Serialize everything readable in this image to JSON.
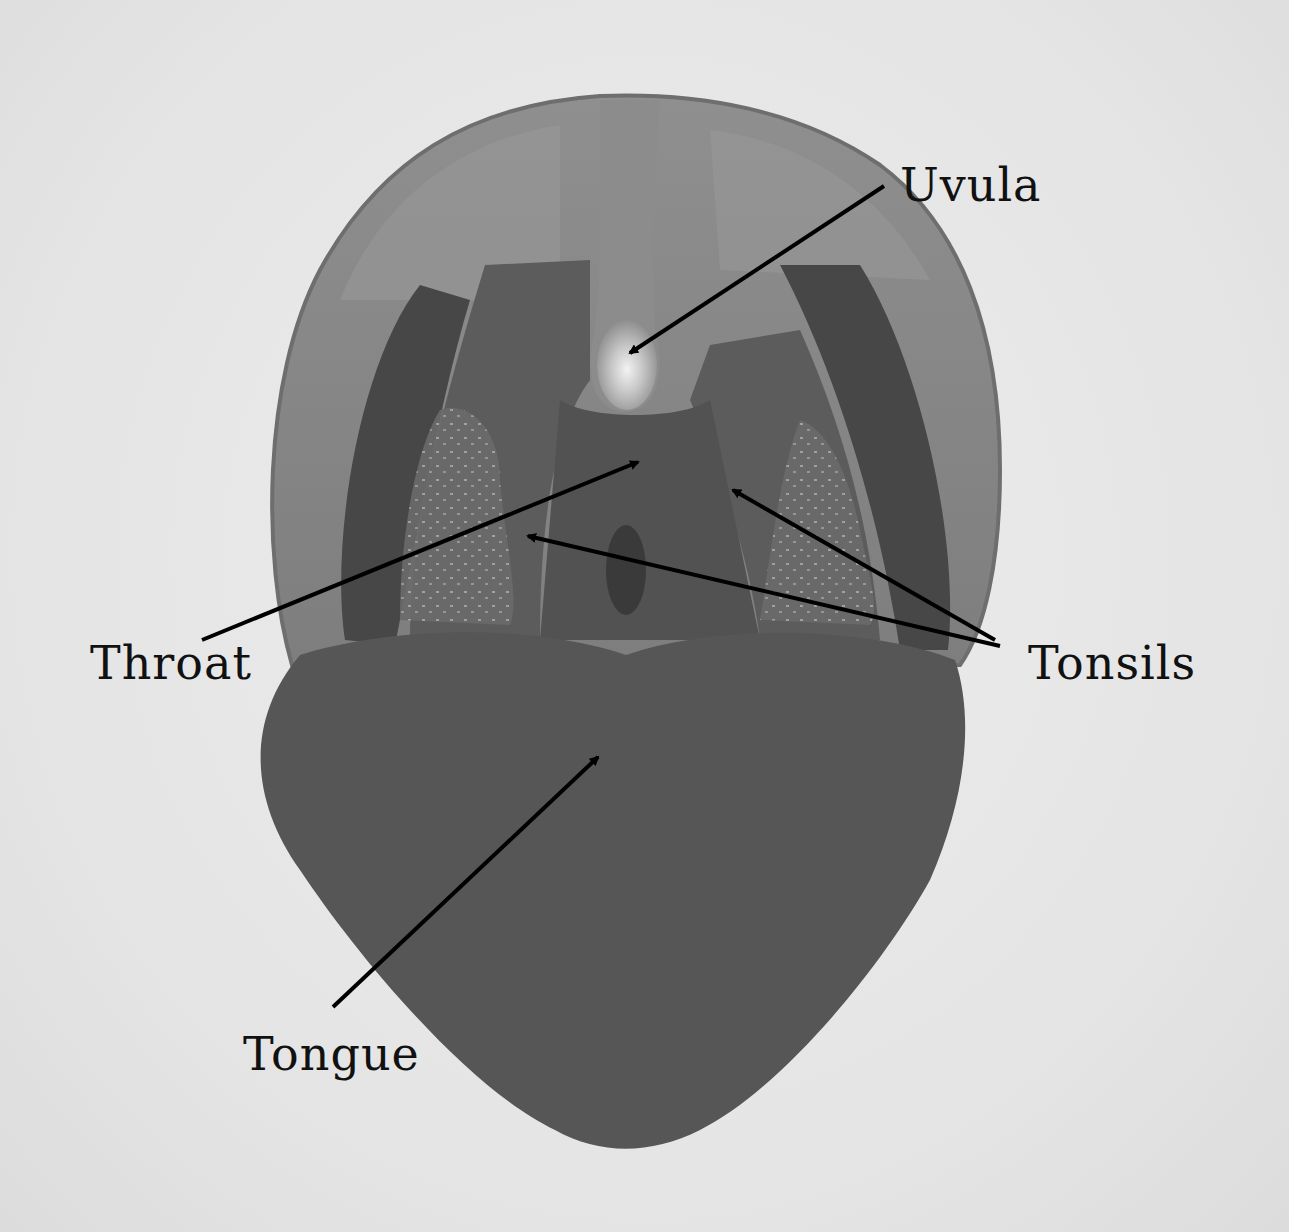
{
  "diagram": {
    "type": "anatomical-labeled-illustration",
    "colors": {
      "background": "#e6e6e6",
      "palate_outer": "#8a8a8a",
      "palate_inner": "#7c7c7c",
      "cavity_dark": "#5a5a5a",
      "throat_dark": "#4e4e4e",
      "tongue": "#565656",
      "uvula_highlight": "#d8d8d8",
      "arrow": "#000000",
      "label_text": "#111111"
    },
    "labels": [
      {
        "id": "uvula",
        "text": "Uvula"
      },
      {
        "id": "throat",
        "text": "Throat"
      },
      {
        "id": "tonsils",
        "text": "Tonsils"
      },
      {
        "id": "tongue",
        "text": "Tongue"
      }
    ]
  }
}
